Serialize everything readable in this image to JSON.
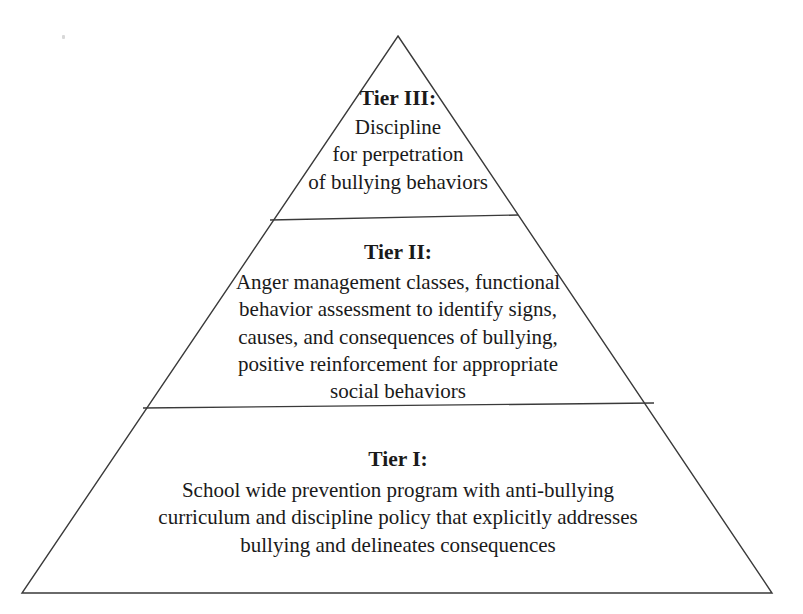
{
  "figure": {
    "name": "bullying-prevention-tier-pyramid",
    "shape": "triangle",
    "background_color": "#ffffff",
    "line_color": "#3a3a3a",
    "text_color": "#1a1a1a"
  },
  "geometry": {
    "apex": {
      "x": 398,
      "y": 36
    },
    "base_left": {
      "x": 22,
      "y": 593
    },
    "base_right": {
      "x": 772,
      "y": 593
    },
    "divider_upper": {
      "x1": 270,
      "y1": 220,
      "x2": 518,
      "y2": 215
    },
    "divider_lower": {
      "x1": 143,
      "y1": 408,
      "x2": 654,
      "y2": 403
    }
  },
  "tiers": [
    {
      "id": "tier-3",
      "heading": "Tier III:",
      "position": "top",
      "lines": [
        "Discipline",
        "for perpetration",
        "of bullying behaviors"
      ]
    },
    {
      "id": "tier-2",
      "heading": "Tier II:",
      "position": "middle",
      "lines": [
        "Anger management classes, functional",
        "behavior assessment to identify signs,",
        "causes, and consequences of bullying,",
        "positive reinforcement for appropriate",
        "social behaviors"
      ]
    },
    {
      "id": "tier-1",
      "heading": "Tier I:",
      "position": "bottom",
      "lines": [
        "School wide prevention program with anti-bullying",
        "curriculum and discipline policy that explicitly addresses",
        "bullying and delineates consequences"
      ]
    }
  ]
}
